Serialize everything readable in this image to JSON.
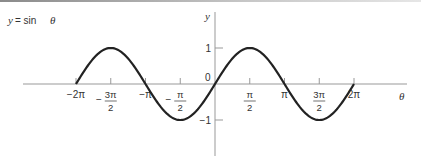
{
  "chart_data": {
    "type": "line",
    "title": "y = sin θ",
    "title_parts": {
      "var": "y",
      "eq": " = sin ",
      "arg": "θ"
    },
    "xlabel": "θ",
    "ylabel": "y",
    "function": "sin",
    "xlim_units_of_pi": [
      -2,
      2
    ],
    "ylim": [
      -1,
      1
    ],
    "x_ticks": [
      {
        "value_pi": -2,
        "label": "−2π",
        "frac": false
      },
      {
        "value_pi": -1.5,
        "label_num": "3π",
        "label_den": "2",
        "sign": "−",
        "frac": true
      },
      {
        "value_pi": -1,
        "label": "−π",
        "frac": false
      },
      {
        "value_pi": -0.5,
        "label_num": "π",
        "label_den": "2",
        "sign": "−",
        "frac": true
      },
      {
        "value_pi": 0.5,
        "label_num": "π",
        "label_den": "2",
        "sign": "",
        "frac": true
      },
      {
        "value_pi": 1,
        "label": "π",
        "frac": false
      },
      {
        "value_pi": 1.5,
        "label_num": "3π",
        "label_den": "2",
        "sign": "",
        "frac": true
      },
      {
        "value_pi": 2,
        "label": "2π",
        "frac": false
      }
    ],
    "y_ticks": [
      {
        "value": 1,
        "label": "1"
      },
      {
        "value": -1,
        "label": "−1"
      }
    ],
    "origin_label": "0",
    "line_color": "#222222",
    "axis_color": "#999999"
  }
}
